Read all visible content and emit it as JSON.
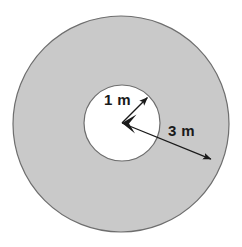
{
  "figure": {
    "type": "geometry-diagram",
    "canvas": {
      "width": 242,
      "height": 247,
      "background": "#ffffff"
    }
  },
  "shapes": {
    "outer_circle": {
      "name": "outer-circle",
      "center_x": 121,
      "center_y": 124,
      "radius": 108,
      "fill": "#c9c9c9",
      "stroke": "#6e6e6e",
      "stroke_width": 1.2
    },
    "inner_circle": {
      "name": "inner-circle",
      "center_x": 122,
      "center_y": 123,
      "radius": 38,
      "fill": "#ffffff",
      "stroke": "#6e6e6e",
      "stroke_width": 1.2
    }
  },
  "dimensions": [
    {
      "id": "inner-radius",
      "label": "1 m",
      "value": 1,
      "unit": "m",
      "from_x": 122,
      "from_y": 123,
      "to_x": 149,
      "to_y": 96,
      "label_x": 104,
      "label_y": 92,
      "color": "#1a1a1a"
    },
    {
      "id": "outer-radius",
      "label": "3 m",
      "value": 3,
      "unit": "m",
      "from_x": 122,
      "from_y": 123,
      "to_x": 213,
      "to_y": 160,
      "label_x": 168,
      "label_y": 123,
      "color": "#1a1a1a"
    }
  ],
  "labels": {
    "inner_radius": "1 m",
    "outer_radius": "3 m"
  },
  "colors": {
    "ring_fill": "#c9c9c9",
    "hole_fill": "#ffffff",
    "outline": "#6e6e6e",
    "arrow": "#1a1a1a",
    "text": "#1a1a1a"
  }
}
